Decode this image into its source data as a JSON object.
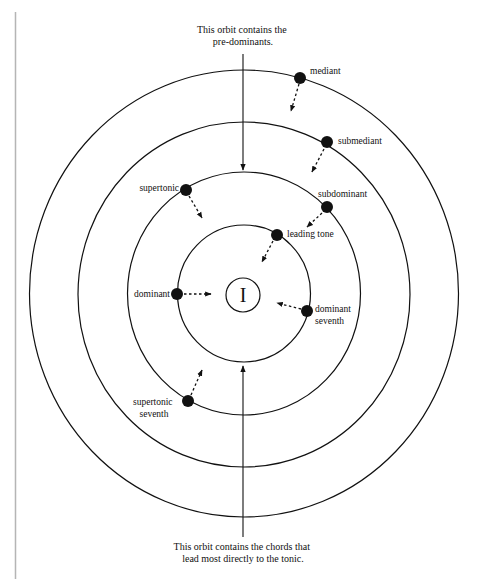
{
  "captions": {
    "top": [
      "This orbit contains the",
      "pre-dominants."
    ],
    "bottom": [
      "This orbit contains the chords that",
      "lead most directly to the tonic."
    ]
  },
  "tonic": {
    "symbol": "I"
  },
  "orbits": [
    {
      "name": "inner-orbit",
      "rx": 66.5,
      "ry": 68.5
    },
    {
      "name": "pre-dominant-orbit",
      "rx": 116.5,
      "ry": 121.5
    },
    {
      "name": "third-orbit",
      "rx": 166,
      "ry": 172.5
    },
    {
      "name": "outer-orbit",
      "rx": 214.5,
      "ry": 223.5
    }
  ],
  "chords": [
    {
      "label": "mediant"
    },
    {
      "label": "submediant"
    },
    {
      "label": "supertonic"
    },
    {
      "label": "subdominant"
    },
    {
      "label": "leading tone"
    },
    {
      "label": "dominant"
    },
    {
      "label": "dominant",
      "label2": "seventh"
    },
    {
      "label": "supertonic",
      "label2": "seventh"
    }
  ],
  "colors": {
    "ink": "#111111",
    "margin_rule": "#b5b5b5",
    "background": "#ffffff"
  }
}
